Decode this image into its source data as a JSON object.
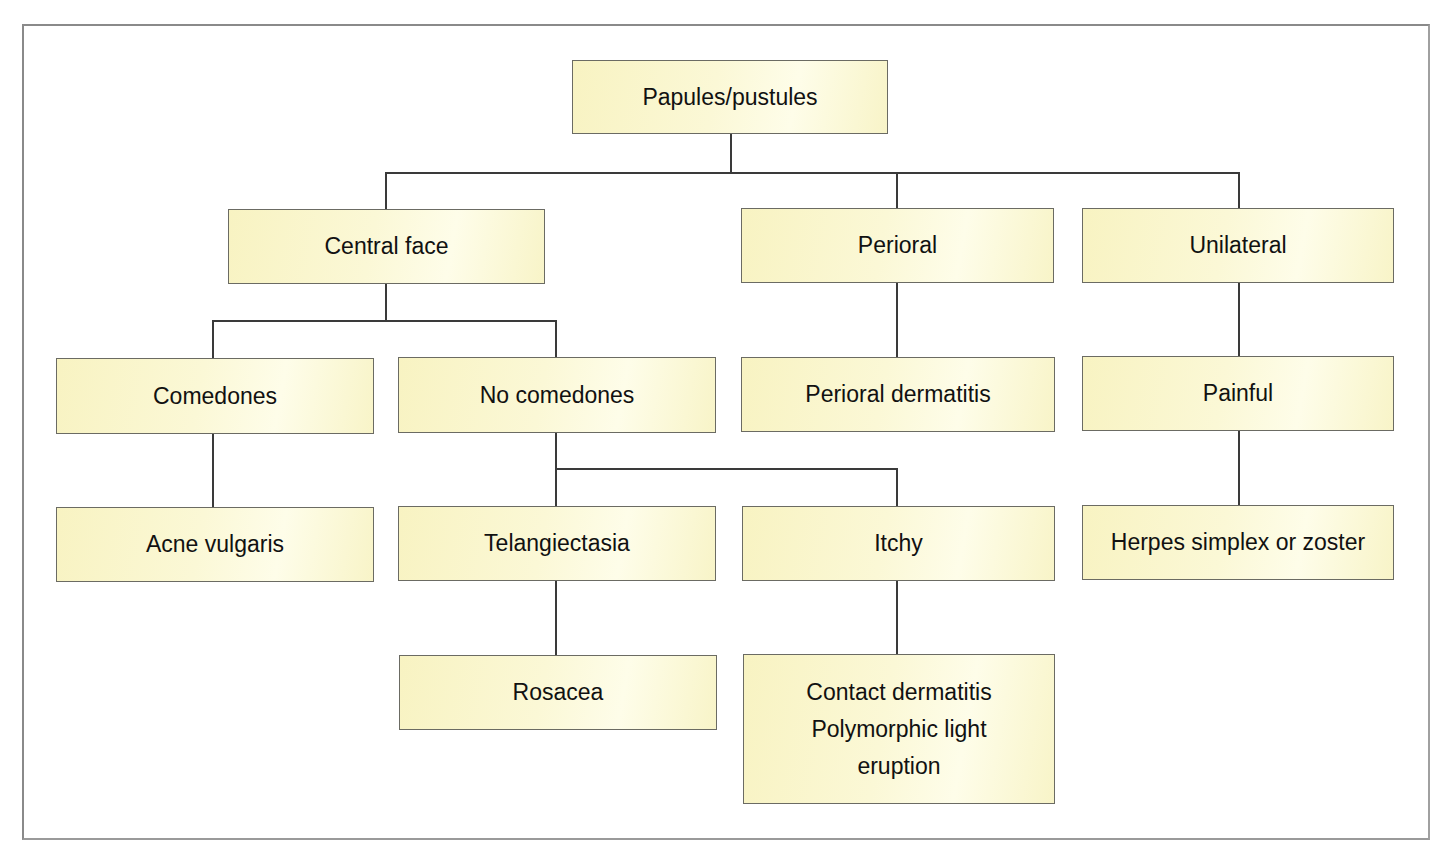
{
  "diagram": {
    "type": "decision-tree",
    "colors": {
      "box_fill": "#fbf8d6",
      "box_border": "#6b6b63",
      "connector": "#3a3a3a",
      "frame": "#8a8a8a"
    },
    "nodes": {
      "root": "Papules/pustules",
      "central_face": "Central face",
      "perioral": "Perioral",
      "unilateral": "Unilateral",
      "comedones": "Comedones",
      "no_comedones": "No comedones",
      "perioral_dermatitis": "Perioral dermatitis",
      "painful": "Painful",
      "acne_vulgaris": "Acne vulgaris",
      "telangiectasia": "Telangiectasia",
      "itchy": "Itchy",
      "herpes": "Herpes simplex or zoster",
      "rosacea": "Rosacea",
      "contact_polymorphic": "Contact dermatitis\nPolymorphic light\neruption"
    },
    "edges": [
      [
        "Papules/pustules",
        "Central face"
      ],
      [
        "Papules/pustules",
        "Perioral"
      ],
      [
        "Papules/pustules",
        "Unilateral"
      ],
      [
        "Central face",
        "Comedones"
      ],
      [
        "Central face",
        "No comedones"
      ],
      [
        "Perioral",
        "Perioral dermatitis"
      ],
      [
        "Unilateral",
        "Painful"
      ],
      [
        "Comedones",
        "Acne vulgaris"
      ],
      [
        "No comedones",
        "Telangiectasia"
      ],
      [
        "No comedones",
        "Itchy"
      ],
      [
        "Painful",
        "Herpes simplex or zoster"
      ],
      [
        "Telangiectasia",
        "Rosacea"
      ],
      [
        "Itchy",
        "Contact dermatitis / Polymorphic light eruption"
      ]
    ]
  }
}
